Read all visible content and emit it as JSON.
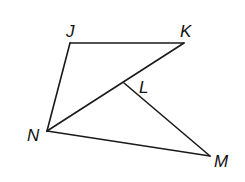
{
  "diagram": {
    "points": [
      {
        "name": "J",
        "x": 70,
        "y": 43,
        "label_x": 66,
        "label_y": 37
      },
      {
        "name": "K",
        "x": 184,
        "y": 43,
        "label_x": 180,
        "label_y": 37
      },
      {
        "name": "L",
        "x": 124,
        "y": 83,
        "label_x": 139,
        "label_y": 93
      },
      {
        "name": "N",
        "x": 47,
        "y": 131,
        "label_x": 27,
        "label_y": 141
      },
      {
        "name": "M",
        "x": 210,
        "y": 156,
        "label_x": 214,
        "label_y": 167
      }
    ],
    "segments": [
      {
        "from": "J",
        "to": "K"
      },
      {
        "from": "J",
        "to": "N"
      },
      {
        "from": "N",
        "to": "K"
      },
      {
        "from": "L",
        "to": "M"
      },
      {
        "from": "N",
        "to": "M"
      }
    ],
    "colors": {
      "stroke": "#1a1a1a",
      "background": "#ffffff"
    }
  }
}
